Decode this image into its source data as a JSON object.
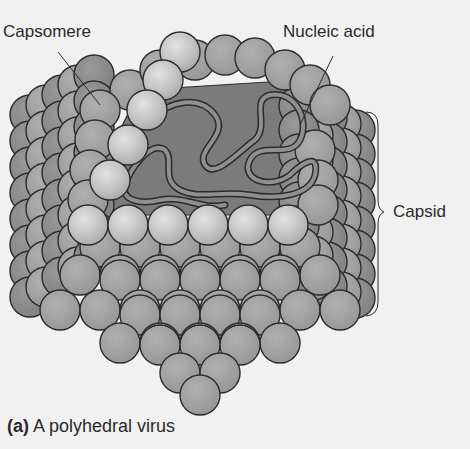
{
  "figure": {
    "type": "polyhedral virus illustration",
    "labels": {
      "capsomere": "Capsomere",
      "nucleic_acid": "Nucleic acid",
      "capsid": "Capsid"
    },
    "caption": {
      "letter": "(a)",
      "text": "A polyhedral virus"
    },
    "colors": {
      "background": "#f1f1f1",
      "sphere_dark": "#8a8a8a",
      "sphere_mid": "#9e9e9e",
      "sphere_light": "#c4c4c4",
      "interior": "#7a7a7a",
      "outline": "#2b2b2b",
      "text": "#2a2a2a"
    }
  }
}
